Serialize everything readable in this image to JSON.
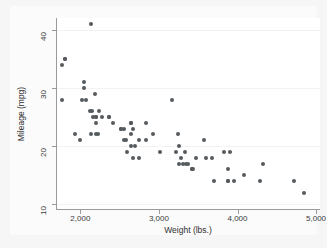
{
  "chart_data": {
    "type": "scatter",
    "title": "",
    "xlabel": "Weight (lbs.)",
    "ylabel": "Mileage (mpg)",
    "xlim": [
      1690,
      5050
    ],
    "ylim": [
      9.2,
      42.0
    ],
    "xticks": [
      2000,
      3000,
      4000,
      5000
    ],
    "xticklabels": [
      "2,000",
      "3,000",
      "4,000",
      "5,000"
    ],
    "yticks": [
      10,
      20,
      30,
      40
    ],
    "yticklabels": [
      "10",
      "20",
      "30",
      "40"
    ],
    "grid": "horizontal-faint",
    "legend": "none",
    "marker_color": "#555a5e",
    "background_color": "#f6f6f6",
    "plot_background_color": "#ffffff",
    "n_points": 74,
    "series": [
      {
        "name": "Automobiles",
        "x": [
          2930,
          3350,
          2640,
          3250,
          4080,
          3670,
          3880,
          4330,
          3900,
          4290,
          3570,
          3240,
          4720,
          3430,
          3260,
          3600,
          3700,
          3955,
          3830,
          4840,
          2200,
          2150,
          2670,
          2595,
          2700,
          2556,
          2130,
          2650,
          1800,
          2200,
          1930,
          1990,
          3310,
          3370,
          2830,
          3220,
          2070,
          3280,
          3420,
          3885,
          3015,
          2190,
          2200,
          2520,
          2560,
          3330,
          3885,
          3470,
          2830,
          2200,
          2520,
          2410,
          2750,
          2120,
          2160,
          2040,
          2670,
          1760,
          2050,
          1800,
          1760,
          2020,
          2580,
          2130,
          2370,
          2280,
          2750,
          2240,
          2230,
          2370,
          3170,
          2650,
          2640,
          3420
        ],
        "y": [
          22,
          17,
          22,
          20,
          15,
          18,
          16,
          17,
          19,
          14,
          21,
          22,
          14,
          16,
          17,
          18,
          14,
          14,
          19,
          12,
          25,
          26,
          18,
          19,
          20,
          21,
          22,
          20,
          35,
          24,
          22,
          21,
          17,
          17,
          21,
          19,
          28,
          18,
          16,
          14,
          19,
          29,
          22,
          23,
          23,
          19,
          14,
          18,
          24,
          25,
          23,
          24,
          18,
          26,
          25,
          31,
          23,
          34,
          30,
          35,
          28,
          28,
          21,
          41,
          25,
          25,
          21,
          26,
          22,
          25,
          28,
          24,
          24,
          16
        ]
      }
    ]
  },
  "axes": {
    "y_title": "Mileage (mpg)",
    "x_title": "Weight (lbs.)"
  }
}
